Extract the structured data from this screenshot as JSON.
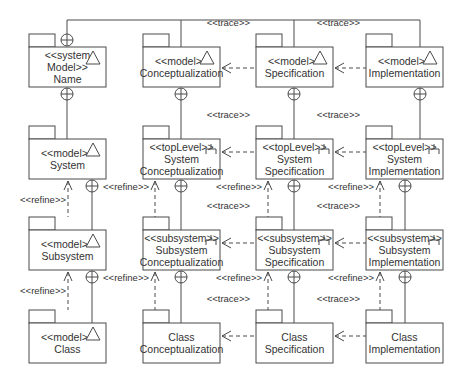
{
  "diagram": {
    "type": "UML package diagram",
    "packages": [
      {
        "id": "system-model-name",
        "lines": [
          "<<system",
          "Model>>",
          "Name"
        ],
        "icon": "model-triangle-icon"
      },
      {
        "id": "conceptualization",
        "lines": [
          "<<model>>",
          "Conceptualization"
        ],
        "icon": "model-triangle-icon"
      },
      {
        "id": "specification",
        "lines": [
          "<<model>>",
          "Specification"
        ],
        "icon": "model-triangle-icon"
      },
      {
        "id": "implementation",
        "lines": [
          "<<model>>",
          "Implementation"
        ],
        "icon": "model-triangle-icon"
      },
      {
        "id": "system",
        "lines": [
          "<<model>>",
          "System"
        ],
        "icon": "model-triangle-icon"
      },
      {
        "id": "system-conceptualization",
        "lines": [
          "<<topLevel>>",
          "System",
          "Conceptualization"
        ],
        "icon": "subsystem-fork-icon"
      },
      {
        "id": "system-specification",
        "lines": [
          "<<topLevel>>",
          "System",
          "Specification"
        ],
        "icon": "subsystem-fork-icon"
      },
      {
        "id": "system-implementation",
        "lines": [
          "<<topLevel>>",
          "System",
          "Implementation"
        ],
        "icon": "subsystem-fork-icon"
      },
      {
        "id": "subsystem",
        "lines": [
          "<<model>>",
          "Subsystem"
        ],
        "icon": "model-triangle-icon"
      },
      {
        "id": "subsystem-conceptualization",
        "lines": [
          "<<subsystem>>",
          "Subsystem",
          "Conceptualization"
        ],
        "icon": "subsystem-fork-icon"
      },
      {
        "id": "subsystem-specification",
        "lines": [
          "<<subsystem>>",
          "Subsystem",
          "Specification"
        ],
        "icon": "subsystem-fork-icon"
      },
      {
        "id": "subsystem-implementation",
        "lines": [
          "<<subsystem>>",
          "Subsystem",
          "Implementation"
        ],
        "icon": "subsystem-fork-icon"
      },
      {
        "id": "class",
        "lines": [
          "<<model>>",
          "Class"
        ],
        "icon": "model-triangle-icon"
      },
      {
        "id": "class-conceptualization",
        "lines": [
          "Class",
          "Conceptualization"
        ],
        "icon": null
      },
      {
        "id": "class-specification",
        "lines": [
          "Class",
          "Specification"
        ],
        "icon": null
      },
      {
        "id": "class-implementation",
        "lines": [
          "Class",
          "Implementation"
        ],
        "icon": null
      }
    ],
    "edge_labels": {
      "trace": "<<trace>>",
      "refine": "<<refine>>"
    },
    "relationships": [
      {
        "from": "specification",
        "to": "conceptualization",
        "kind": "trace"
      },
      {
        "from": "implementation",
        "to": "specification",
        "kind": "trace"
      },
      {
        "from": "system-specification",
        "to": "system-conceptualization",
        "kind": "trace"
      },
      {
        "from": "system-implementation",
        "to": "system-specification",
        "kind": "trace"
      },
      {
        "from": "subsystem-specification",
        "to": "subsystem-conceptualization",
        "kind": "trace"
      },
      {
        "from": "subsystem-implementation",
        "to": "subsystem-specification",
        "kind": "trace"
      },
      {
        "from": "class-specification",
        "to": "class-conceptualization",
        "kind": "trace"
      },
      {
        "from": "class-implementation",
        "to": "class-specification",
        "kind": "trace"
      },
      {
        "from": "subsystem",
        "to": "system",
        "kind": "refine"
      },
      {
        "from": "class",
        "to": "subsystem",
        "kind": "refine"
      },
      {
        "from": "subsystem-conceptualization",
        "to": "system-conceptualization",
        "kind": "refine"
      },
      {
        "from": "subsystem-specification",
        "to": "system-specification",
        "kind": "refine"
      },
      {
        "from": "subsystem-implementation",
        "to": "system-implementation",
        "kind": "refine"
      },
      {
        "from": "class-conceptualization",
        "to": "subsystem-conceptualization",
        "kind": "refine"
      },
      {
        "from": "class-specification",
        "to": "subsystem-specification",
        "kind": "refine"
      },
      {
        "from": "class-implementation",
        "to": "subsystem-implementation",
        "kind": "refine"
      }
    ]
  }
}
